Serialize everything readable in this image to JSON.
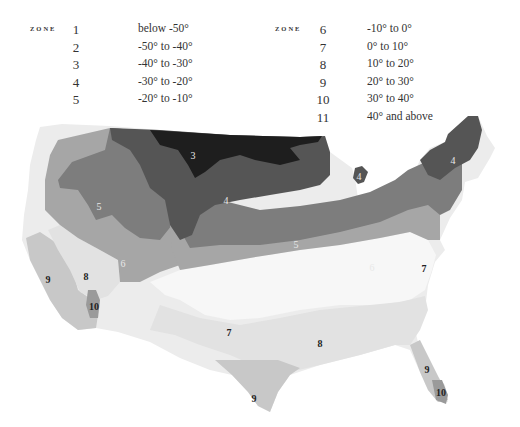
{
  "legend": {
    "header": "ZONE",
    "left": [
      {
        "zone": "1",
        "range": "below -50°"
      },
      {
        "zone": "2",
        "range": "-50° to -40°"
      },
      {
        "zone": "3",
        "range": "-40° to -30°"
      },
      {
        "zone": "4",
        "range": "-30° to -20°"
      },
      {
        "zone": "5",
        "range": "-20° to -10°"
      }
    ],
    "right": [
      {
        "zone": "6",
        "range": "-10° to 0°"
      },
      {
        "zone": "7",
        "range": "0° to 10°"
      },
      {
        "zone": "8",
        "range": "10° to 20°"
      },
      {
        "zone": "9",
        "range": "20° to 30°"
      },
      {
        "zone": "10",
        "range": "30° to 40°"
      },
      {
        "zone": "11",
        "range": "40° and above"
      }
    ]
  },
  "map": {
    "title": "USDA hardiness zone map of the contiguous United States",
    "zone_colors": {
      "3": "#1e1e1e",
      "4": "#555555",
      "5": "#7d7d7d",
      "6": "#a6a6a6",
      "7": "#f7f7f7",
      "8": "#e2e2e2",
      "9": "#c8c8c8",
      "10": "#9a9a9a",
      "coast": "#ececec"
    },
    "labels": [
      {
        "zone": "3",
        "x": 193,
        "y": 155
      },
      {
        "zone": "4",
        "x": 226,
        "y": 200
      },
      {
        "zone": "4",
        "x": 453,
        "y": 160
      },
      {
        "zone": "4",
        "x": 359,
        "y": 176
      },
      {
        "zone": "5",
        "x": 99,
        "y": 206
      },
      {
        "zone": "5",
        "x": 296,
        "y": 244
      },
      {
        "zone": "6",
        "x": 123,
        "y": 263
      },
      {
        "zone": "6",
        "x": 372,
        "y": 267
      },
      {
        "zone": "7",
        "x": 424,
        "y": 268
      },
      {
        "zone": "7",
        "x": 229,
        "y": 332
      },
      {
        "zone": "8",
        "x": 86,
        "y": 276
      },
      {
        "zone": "8",
        "x": 320,
        "y": 343
      },
      {
        "zone": "9",
        "x": 48,
        "y": 279
      },
      {
        "zone": "9",
        "x": 254,
        "y": 398
      },
      {
        "zone": "9",
        "x": 427,
        "y": 369
      },
      {
        "zone": "10",
        "x": 94,
        "y": 306
      },
      {
        "zone": "10",
        "x": 441,
        "y": 392
      }
    ]
  }
}
